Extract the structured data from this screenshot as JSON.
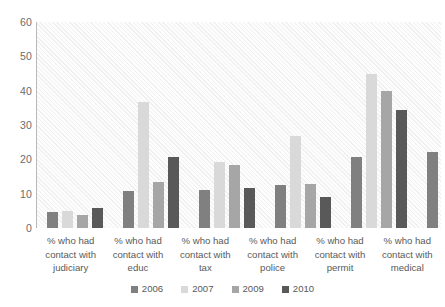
{
  "chart_data": {
    "type": "bar",
    "title": "",
    "subtitle": "",
    "xlabel": "",
    "ylabel": "",
    "ylim": [
      0,
      60
    ],
    "yticks": [
      0,
      10,
      20,
      30,
      40,
      50,
      60
    ],
    "grid": false,
    "legend_position": "bottom",
    "categories": [
      "% who had contact with judiciary",
      "% who had contact with educ",
      "% who had contact with tax",
      "% who had contact with police",
      "% who had contact with permit",
      "% who had contact with medical"
    ],
    "series": [
      {
        "name": "2006",
        "color": "#808080",
        "values": [
          4.6,
          10.9,
          11.2,
          12.5,
          20.8,
          22.1
        ]
      },
      {
        "name": "2007",
        "color": "#d9d9d9",
        "values": [
          5.1,
          36.7,
          19.1,
          26.8,
          45.0,
          52.0
        ]
      },
      {
        "name": "2009",
        "color": "#a6a6a6",
        "values": [
          3.9,
          13.5,
          18.3,
          12.8,
          39.9,
          18.3
        ]
      },
      {
        "name": "2010",
        "color": "#595959",
        "values": [
          5.7,
          20.7,
          11.7,
          8.9,
          34.3,
          31.1
        ]
      }
    ]
  },
  "axis": {
    "y_tick_labels": [
      "60",
      "50",
      "40",
      "30",
      "20",
      "10",
      "0"
    ]
  },
  "legend": {
    "items": [
      {
        "label": "2006"
      },
      {
        "label": "2007"
      },
      {
        "label": "2009"
      },
      {
        "label": "2010"
      }
    ]
  }
}
